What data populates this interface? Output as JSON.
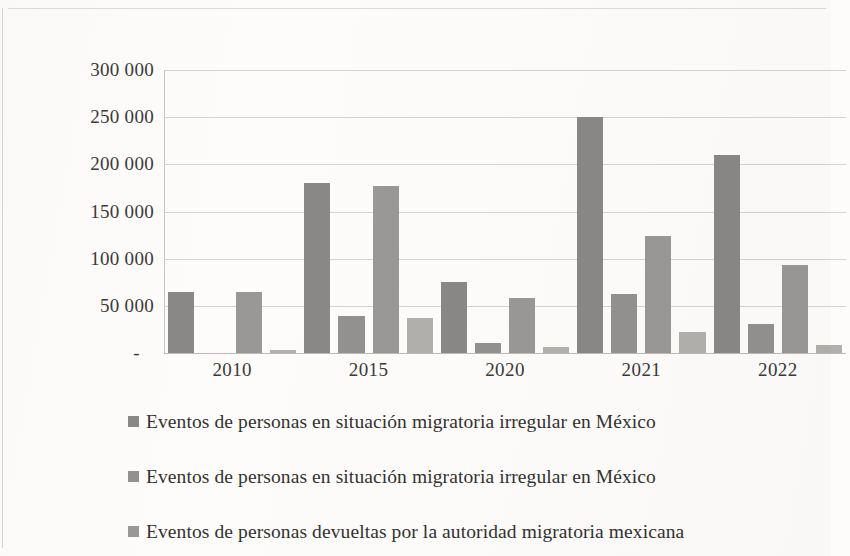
{
  "chart_data": {
    "type": "bar",
    "title": "",
    "subtitle": "",
    "xlabel": "",
    "ylabel": "",
    "grid": true,
    "legend_position": "bottom",
    "categories": [
      "2010",
      "2015",
      "2020",
      "2021",
      "2022"
    ],
    "ylim": [
      0,
      300000
    ],
    "yticks": [
      0,
      50000,
      100000,
      150000,
      200000,
      250000,
      300000
    ],
    "ytick_labels": [
      "-",
      "50 000",
      "100 000",
      "150 000",
      "200 000",
      "250 000",
      "300 000"
    ],
    "series": [
      {
        "name": "Eventos de personas en situación migratoria irregular en México",
        "color": "#8a8886",
        "values": [
          65000,
          180000,
          75000,
          250000,
          210000
        ]
      },
      {
        "name": "Eventos de personas en situación migratoria irregular en México",
        "color": "#939190",
        "values": [
          0,
          39000,
          11000,
          63000,
          31000
        ]
      },
      {
        "name": "Eventos de personas devueltas por la autoridad migratoria mexicana",
        "color": "#9a9896",
        "values": [
          65000,
          177000,
          58000,
          124000,
          93000
        ]
      },
      {
        "name": "",
        "color": "#b2b0ad",
        "values": [
          3000,
          37000,
          6000,
          22000,
          8000
        ]
      }
    ]
  },
  "axis": {
    "y_labels": [
      {
        "value": 300000,
        "text": "300 000"
      },
      {
        "value": 250000,
        "text": "250 000"
      },
      {
        "value": 200000,
        "text": "200 000"
      },
      {
        "value": 150000,
        "text": "150 000"
      },
      {
        "value": 100000,
        "text": "100 000"
      },
      {
        "value": 50000,
        "text": "50 000"
      },
      {
        "value": 0,
        "text": "-"
      }
    ],
    "x_labels": [
      "2010",
      "2015",
      "2020",
      "2021",
      "2022"
    ]
  },
  "legend": {
    "items": [
      {
        "label": "Eventos de personas en situación migratoria irregular en México",
        "color": "#8a8886"
      },
      {
        "label": "Eventos de personas en situación migratoria irregular en México",
        "color": "#939190"
      },
      {
        "label": "Eventos de personas devueltas por la autoridad migratoria mexicana",
        "color": "#9a9896"
      }
    ]
  }
}
